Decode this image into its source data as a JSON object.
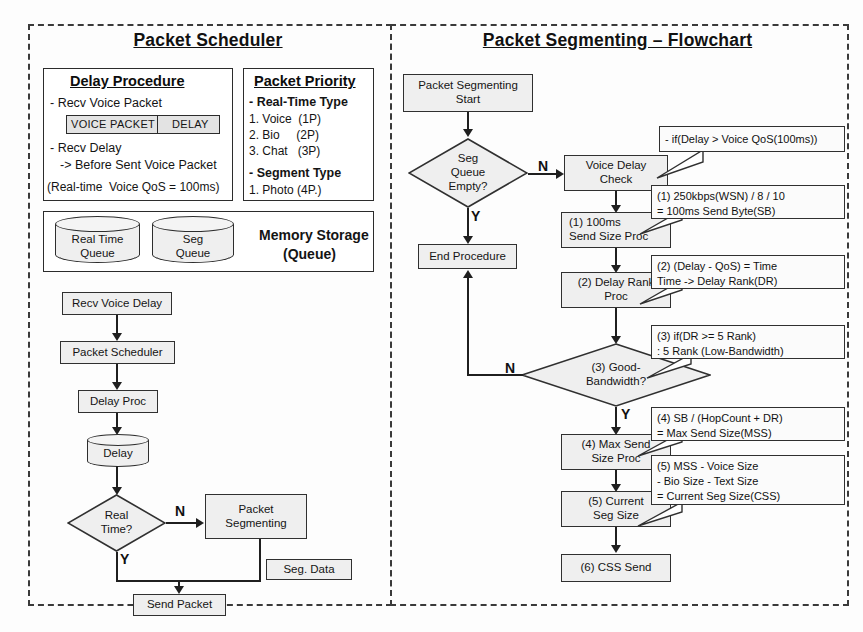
{
  "left_panel": {
    "title": "Packet Scheduler",
    "delay_procedure": {
      "heading": "Delay Procedure",
      "line1": "- Recv Voice Packet",
      "bar_left": "VOICE PACKET",
      "bar_right": "DELAY",
      "line2": "- Recv Delay",
      "line3": "-> Before Sent Voice Packet",
      "line4": "(Real-time  Voice QoS = 100ms)"
    },
    "packet_priority": {
      "heading": "Packet Priority",
      "group1": "- Real-Time Type",
      "items1": [
        "1. Voice  (1P)",
        "2. Bio     (2P)",
        "3. Chat   (3P)"
      ],
      "group2": "- Segment Type",
      "items2": [
        "1. Photo (4P.)"
      ]
    },
    "memory_storage": {
      "title_line1": "Memory Storage",
      "title_line2": "(Queue)",
      "queues": [
        {
          "line1": "Real Time",
          "line2": "Queue"
        },
        {
          "line1": "Seg",
          "line2": "Queue"
        }
      ]
    },
    "flow": {
      "recv_voice_delay": "Recv Voice Delay",
      "packet_scheduler": "Packet Scheduler",
      "delay_proc": "Delay Proc",
      "delay_store": "Delay",
      "real_time_q": "Real\nTime?",
      "branch_no": "N",
      "branch_yes": "Y",
      "packet_segmenting": "Packet\nSegmenting",
      "seg_data": "Seg. Data",
      "send_packet": "Send Packet"
    }
  },
  "right_panel": {
    "title": "Packet Segmenting – Flowchart",
    "flow": {
      "start": "Packet Segmenting\nStart",
      "seg_queue_empty": "Seg\nQueue\nEmpty?",
      "branch_n1": "N",
      "branch_y1": "Y",
      "end_procedure": "End Procedure",
      "voice_delay_check": "Voice Delay\nCheck",
      "step1": "(1) 100ms\nSend Size Proc",
      "step2": "(2) Delay Rank\nProc",
      "step3": "(3) Good-\nBandwidth?",
      "branch_n2": "N",
      "branch_y2": "Y",
      "step4": "(4) Max Send\nSize Proc",
      "step5": "(5) Current\nSeg Size",
      "step6": "(6) CSS Send"
    },
    "notes": [
      {
        "id": "note-if-delay",
        "lines": [
          "- if(Delay > Voice QoS(100ms))"
        ]
      },
      {
        "id": "note-1",
        "lines": [
          "(1) 250kbps(WSN) / 8 / 10",
          "       = 100ms Send Byte(SB)"
        ]
      },
      {
        "id": "note-2",
        "lines": [
          "(2) (Delay - QoS) = Time",
          "       Time -> Delay Rank(DR)"
        ]
      },
      {
        "id": "note-3",
        "lines": [
          "(3) if(DR >= 5 Rank)",
          "      : 5 Rank (Low-Bandwidth)"
        ]
      },
      {
        "id": "note-4",
        "lines": [
          "(4) SB / (HopCount + DR)",
          "       = Max Send Size(MSS)"
        ]
      },
      {
        "id": "note-5",
        "lines": [
          "(5) MSS - Voice Size",
          "        - Bio Size - Text Size",
          "     = Current Seg Size(CSS)"
        ]
      }
    ]
  },
  "colors": {
    "box_fill": "#efefef",
    "border": "#2b2b2b",
    "panel_border": "#3a3a3a",
    "note_fill": "#fbfbfb"
  }
}
